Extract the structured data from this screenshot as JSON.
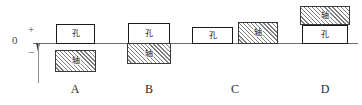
{
  "diagram": {
    "axis": {
      "zero_label": "0",
      "plus_label": "+",
      "minus_label": "−",
      "line_color": "#6b6b6b",
      "arrow_color": "#3d3d3d"
    },
    "legend": {
      "hole_glyph": "孔",
      "shaft_glyph": "轴",
      "hole_meaning": "hole",
      "shaft_meaning": "shaft"
    },
    "groups": [
      {
        "label": "A",
        "fit_type": "clearance",
        "caption_left": 55,
        "boxes": [
          {
            "kind": "hole",
            "glyph": "孔",
            "left": 56,
            "top": 24,
            "width": 39,
            "height": 20
          },
          {
            "kind": "shaft",
            "glyph": "轴",
            "left": 55,
            "top": 50,
            "width": 41,
            "height": 22
          }
        ]
      },
      {
        "label": "B",
        "fit_type": "transition",
        "caption_left": 129,
        "boxes": [
          {
            "kind": "hole",
            "glyph": "孔",
            "left": 128,
            "top": 23,
            "width": 42,
            "height": 21
          },
          {
            "kind": "shaft",
            "glyph": "轴",
            "left": 127,
            "top": 43,
            "width": 44,
            "height": 21
          }
        ]
      },
      {
        "label": "C",
        "fit_type": "transition",
        "caption_left": 215,
        "boxes": [
          {
            "kind": "hole",
            "glyph": "孔",
            "left": 192,
            "top": 27,
            "width": 41,
            "height": 17
          },
          {
            "kind": "shaft",
            "glyph": "轴",
            "left": 238,
            "top": 22,
            "width": 40,
            "height": 22
          }
        ]
      },
      {
        "label": "D",
        "fit_type": "interference",
        "caption_left": 305,
        "boxes": [
          {
            "kind": "shaft",
            "glyph": "轴",
            "left": 300,
            "top": 6,
            "width": 50,
            "height": 19
          },
          {
            "kind": "hole",
            "glyph": "孔",
            "left": 302,
            "top": 25,
            "width": 46,
            "height": 19
          }
        ]
      }
    ]
  }
}
